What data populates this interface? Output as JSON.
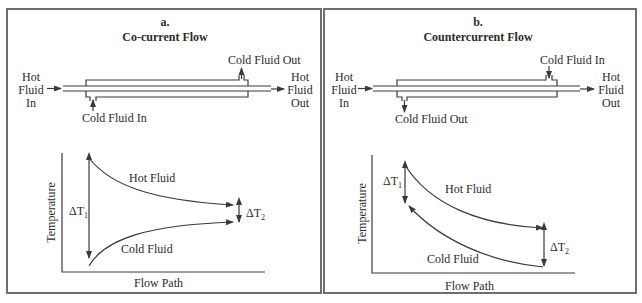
{
  "panels": [
    {
      "id": "a",
      "letter": "a.",
      "title": "Co-current Flow",
      "pipe": {
        "hot_in": [
          "Hot",
          "Fluid",
          "In"
        ],
        "hot_out": [
          "Hot",
          "Fluid",
          "Out"
        ],
        "cold_in": "Cold Fluid In",
        "cold_out": "Cold Fluid Out"
      },
      "graph": {
        "ylabel": "Temperature",
        "xlabel": "Flow Path",
        "hot_curve": "Hot Fluid",
        "cold_curve": "Cold Fluid",
        "delta1": "ΔT",
        "delta1_sub": "1",
        "delta2": "ΔT",
        "delta2_sub": "2"
      }
    },
    {
      "id": "b",
      "letter": "b.",
      "title": "Countercurrent Flow",
      "pipe": {
        "hot_in": [
          "Hot",
          "Fluid",
          "In"
        ],
        "hot_out": [
          "Hot",
          "Fluid",
          "Out"
        ],
        "cold_in": "Cold Fluid In",
        "cold_out": "Cold Fluid Out"
      },
      "graph": {
        "ylabel": "Temperature",
        "xlabel": "Flow Path",
        "hot_curve": "Hot Fluid",
        "cold_curve": "Cold Fluid",
        "delta1": "ΔT",
        "delta1_sub": "1",
        "delta2": "ΔT",
        "delta2_sub": "2"
      }
    }
  ],
  "colors": {
    "line": "#3a3a3a",
    "border": "#6e6e6e",
    "background": "#ffffff"
  }
}
